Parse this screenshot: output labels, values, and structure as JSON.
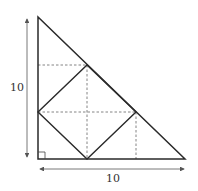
{
  "diagram": {
    "labels": {
      "height": "10",
      "base": "10"
    },
    "colors": {
      "stroke": "#2a2a2a",
      "dashed": "#555555",
      "arrow": "#555555"
    },
    "points": {
      "apex": [
        38,
        17
      ],
      "right_angle": [
        38,
        159
      ],
      "right_vertex": [
        185,
        159
      ],
      "square_left": [
        38,
        112
      ],
      "square_top": [
        87,
        65
      ],
      "square_right": [
        136,
        112
      ],
      "square_bottom": [
        87,
        159
      ]
    }
  }
}
